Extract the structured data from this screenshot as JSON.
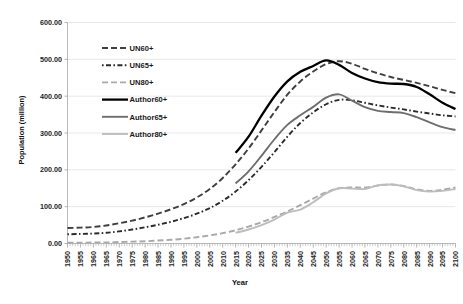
{
  "chart_data": {
    "type": "line",
    "title": "",
    "xlabel": "Year",
    "ylabel": "Population (million)",
    "xlim": [
      1950,
      2100
    ],
    "ylim": [
      0,
      600
    ],
    "ytick_step": 100,
    "xtick_step": 5,
    "grid": true,
    "legend_position": "inside-upper-left",
    "ytick_labels": [
      "0.00",
      "100.00",
      "200.00",
      "300.00",
      "400.00",
      "500.00",
      "600.00"
    ],
    "ytick_values": [
      0,
      100,
      200,
      300,
      400,
      500,
      600
    ],
    "xtick_labels": [
      "1950",
      "1955",
      "1960",
      "1965",
      "1970",
      "1975",
      "1980",
      "1985",
      "1990",
      "1995",
      "2000",
      "2005",
      "2010",
      "2015",
      "2020",
      "2025",
      "2030",
      "2035",
      "2040",
      "2045",
      "2050",
      "2055",
      "2060",
      "2065",
      "2070",
      "2075",
      "2080",
      "2085",
      "2090",
      "2095",
      "2100"
    ],
    "x": [
      1950,
      1955,
      1960,
      1965,
      1970,
      1975,
      1980,
      1985,
      1990,
      1995,
      2000,
      2005,
      2010,
      2015,
      2020,
      2025,
      2030,
      2035,
      2040,
      2045,
      2050,
      2055,
      2060,
      2065,
      2070,
      2075,
      2080,
      2085,
      2090,
      2095,
      2100
    ],
    "series": [
      {
        "name": "UN60+",
        "color": "#3f3f3f",
        "style": "dashed",
        "width": 1.9,
        "dash": "6,3",
        "x": [
          1950,
          1955,
          1960,
          1965,
          1970,
          1975,
          1980,
          1985,
          1990,
          1995,
          2000,
          2005,
          2010,
          2015,
          2020,
          2025,
          2030,
          2035,
          2040,
          2045,
          2050,
          2055,
          2060,
          2065,
          2070,
          2075,
          2080,
          2085,
          2090,
          2095,
          2100
        ],
        "values": [
          42,
          43,
          45,
          49,
          55,
          62,
          71,
          81,
          93,
          107,
          125,
          148,
          178,
          215,
          258,
          307,
          357,
          404,
          440,
          467,
          487,
          495,
          488,
          474,
          462,
          452,
          444,
          436,
          427,
          417,
          408
        ]
      },
      {
        "name": "UN65+",
        "color": "#2b2b2b",
        "style": "dotted",
        "width": 1.9,
        "dash": "1.6,2.4,5,2.4",
        "x": [
          1950,
          1955,
          1960,
          1965,
          1970,
          1975,
          1980,
          1985,
          1990,
          1995,
          2000,
          2005,
          2010,
          2015,
          2020,
          2025,
          2030,
          2035,
          2040,
          2045,
          2050,
          2055,
          2060,
          2065,
          2070,
          2075,
          2080,
          2085,
          2090,
          2095,
          2100
        ],
        "values": [
          25,
          26,
          27,
          29,
          33,
          38,
          44,
          51,
          59,
          69,
          81,
          96,
          116,
          141,
          172,
          208,
          248,
          290,
          327,
          356,
          378,
          390,
          389,
          382,
          375,
          369,
          364,
          358,
          353,
          348,
          345
        ]
      },
      {
        "name": "UN80+",
        "color": "#a9a9a9",
        "style": "dashed",
        "width": 1.9,
        "dash": "6,3",
        "x": [
          1950,
          1955,
          1960,
          1965,
          1970,
          1975,
          1980,
          1985,
          1990,
          1995,
          2000,
          2005,
          2010,
          2015,
          2020,
          2025,
          2030,
          2035,
          2040,
          2045,
          2050,
          2055,
          2060,
          2065,
          2070,
          2075,
          2080,
          2085,
          2090,
          2095,
          2100
        ],
        "values": [
          2,
          2,
          3,
          3,
          4,
          5,
          6,
          8,
          10,
          13,
          17,
          22,
          28,
          36,
          46,
          58,
          72,
          87,
          104,
          122,
          139,
          150,
          152,
          152,
          157,
          160,
          156,
          147,
          143,
          146,
          152
        ]
      },
      {
        "name": "Author60+",
        "color": "#000000",
        "style": "solid",
        "width": 2.3,
        "dash": "",
        "x": [
          2015,
          2020,
          2025,
          2030,
          2035,
          2040,
          2045,
          2050,
          2055,
          2060,
          2065,
          2070,
          2075,
          2080,
          2085,
          2090,
          2095,
          2100
        ],
        "values": [
          246,
          290,
          347,
          399,
          440,
          466,
          482,
          497,
          485,
          463,
          448,
          438,
          434,
          433,
          425,
          405,
          382,
          365
        ]
      },
      {
        "name": "Author65+",
        "color": "#6e6e6e",
        "style": "solid",
        "width": 1.9,
        "dash": "",
        "x": [
          2015,
          2020,
          2025,
          2030,
          2035,
          2040,
          2045,
          2050,
          2055,
          2060,
          2065,
          2070,
          2075,
          2080,
          2085,
          2090,
          2095,
          2100
        ],
        "values": [
          163,
          196,
          238,
          283,
          322,
          348,
          371,
          396,
          405,
          388,
          370,
          360,
          357,
          354,
          343,
          329,
          316,
          308
        ]
      },
      {
        "name": "Author80+",
        "color": "#bdbdbd",
        "style": "solid",
        "width": 1.9,
        "dash": "",
        "x": [
          2015,
          2020,
          2025,
          2030,
          2035,
          2040,
          2045,
          2050,
          2055,
          2060,
          2065,
          2070,
          2075,
          2080,
          2085,
          2090,
          2095,
          2100
        ],
        "values": [
          29,
          38,
          50,
          65,
          84,
          92,
          112,
          136,
          150,
          149,
          148,
          158,
          160,
          155,
          145,
          141,
          143,
          148
        ]
      }
    ]
  },
  "legend": {
    "items": [
      {
        "label": "UN60+"
      },
      {
        "label": "UN65+"
      },
      {
        "label": "UN80+"
      },
      {
        "label": "Author60+"
      },
      {
        "label": "Author65+"
      },
      {
        "label": "Author80+"
      }
    ]
  },
  "axes": {
    "y_title": "Population (million)",
    "x_title": "Year"
  }
}
